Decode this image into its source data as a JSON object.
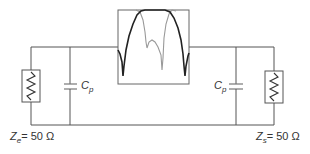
{
  "diagram": {
    "type": "circuit",
    "source_impedance": {
      "symbol": "Z",
      "subscript": "e",
      "equals": "=",
      "value": "50",
      "unit": "Ω"
    },
    "load_impedance": {
      "symbol": "Z",
      "subscript": "s",
      "equals": "=",
      "value": "50",
      "unit": "Ω"
    },
    "capacitors": [
      {
        "symbol": "C",
        "subscript": "p",
        "side": "left"
      },
      {
        "symbol": "C",
        "subscript": "p",
        "side": "right"
      }
    ],
    "inset_plot": {
      "description": "Filter frequency response (two overlaid curves)",
      "curves": [
        {
          "name": "response-dark",
          "color": "#222222"
        },
        {
          "name": "response-light",
          "color": "#999999"
        }
      ]
    },
    "colors": {
      "wire": "#555555",
      "dark_curve": "#222222",
      "light_curve": "#999999"
    }
  }
}
